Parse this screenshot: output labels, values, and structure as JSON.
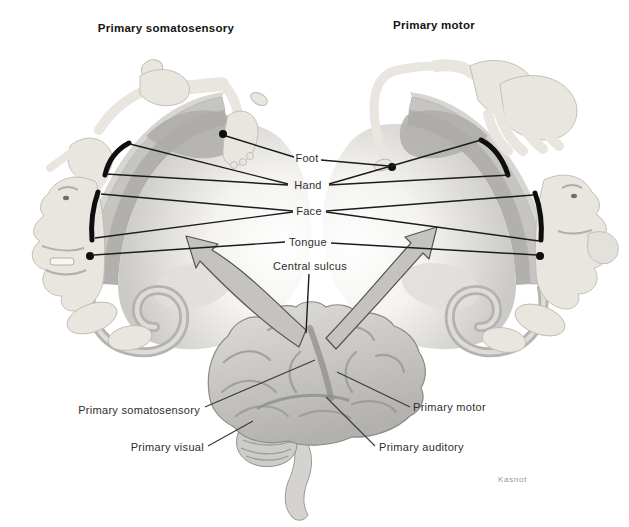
{
  "diagram": {
    "titles": {
      "left": "Primary somatosensory",
      "right": "Primary motor"
    },
    "body_parts": {
      "foot": "Foot",
      "hand": "Hand",
      "face": "Face",
      "tongue": "Tongue"
    },
    "labels": {
      "central_sulcus": "Central sulcus",
      "primary_somatosensory": "Primary somatosensory",
      "primary_visual": "Primary visual",
      "primary_motor": "Primary motor",
      "primary_auditory": "Primary auditory"
    },
    "signature": "Kasnot",
    "colors": {
      "background": "#ffffff",
      "figure_body": "#e9e6df",
      "cortex_band": "#c6c5c2",
      "cortex_inner_ring": "#b1b0ad",
      "brain": "#c9c8c4",
      "arrow_fill": "#c4c3c0",
      "marker_black": "#0e0e0e",
      "leader_line": "#1c1c1c"
    }
  }
}
